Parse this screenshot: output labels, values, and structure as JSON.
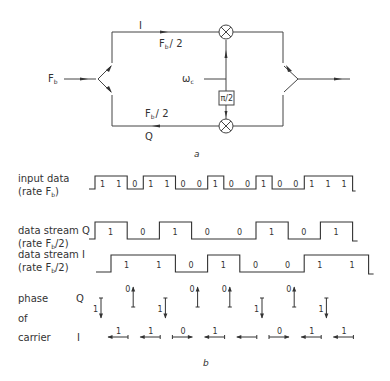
{
  "figure_a": {
    "caption": "a",
    "input_label": "F",
    "input_label_sub": "b",
    "upper_branch": {
      "name": "I",
      "rate_main": "F",
      "rate_sub": "b",
      "rate_den": "/ 2"
    },
    "lower_branch": {
      "name": "Q",
      "rate_main": "F",
      "rate_sub": "b",
      "rate_den": "/ 2"
    },
    "carrier_label": "ω",
    "carrier_sub": "c",
    "phase_shifter": "π/2",
    "mixer_symbol": "⊗"
  },
  "figure_b": {
    "caption": "b",
    "rows": [
      {
        "label_line1": "input data",
        "label_line2": "(rate F",
        "label_sub": "b",
        "label_end": ")"
      },
      {
        "label_line1": "data stream Q",
        "label_line2": "(rate F",
        "label_sub": "b",
        "label_end": "/2)"
      },
      {
        "label_line1": "data stream I",
        "label_line2": "(rate F",
        "label_sub": "b",
        "label_end": "/2)"
      }
    ],
    "input_bits": [
      "1",
      "1",
      "0",
      "1",
      "1",
      "0",
      "0",
      "1",
      "0",
      "0",
      "1",
      "0",
      "0",
      "1",
      "1",
      "1"
    ],
    "q_bits": [
      "1",
      "0",
      "1",
      "0",
      "0",
      "1",
      "0",
      "1"
    ],
    "i_bits": [
      "1",
      "1",
      "0",
      "1",
      "0",
      "0",
      "1",
      "1"
    ],
    "phase_labels": {
      "line1": "phase",
      "line2": "of",
      "line3": "carrier",
      "q": "Q",
      "i": "I"
    },
    "phase_q": [
      "1",
      "0",
      "1",
      "0",
      "0",
      "1",
      "0",
      "1"
    ],
    "phase_i": [
      "1",
      "1",
      "0",
      "1",
      "",
      "0",
      "1",
      "1"
    ]
  }
}
